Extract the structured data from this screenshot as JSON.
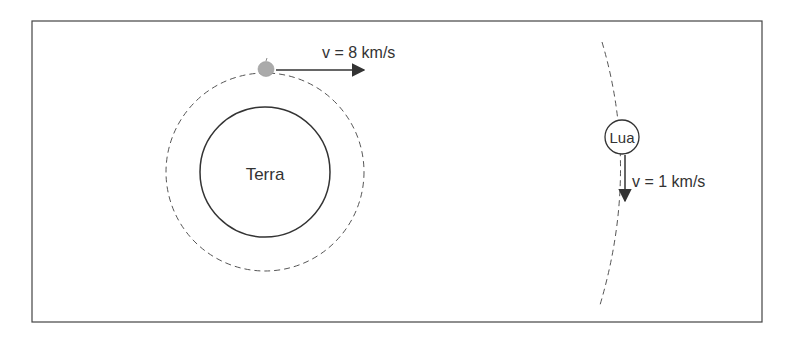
{
  "diagram": {
    "earth": {
      "label": "Terra"
    },
    "satellite": {
      "velocity_label": "v = 8 km/s"
    },
    "moon": {
      "label": "Lua",
      "velocity_label": "v = 1 km/s"
    }
  },
  "colors": {
    "stroke": "#333333",
    "apple": "#a9a9a9",
    "background": "#ffffff"
  }
}
